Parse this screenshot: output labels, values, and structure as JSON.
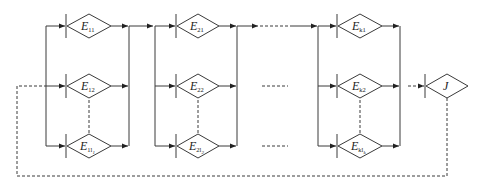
{
  "diagram": {
    "type": "series-parallel block diagram with feedback",
    "stroke_color": "#3a3a3a",
    "background": "#ffffff",
    "stages": [
      {
        "id": "stage-1",
        "nodes": [
          {
            "symbol": "E",
            "sub": "11",
            "subsub": ""
          },
          {
            "symbol": "E",
            "sub": "12",
            "subsub": ""
          },
          {
            "symbol": "E",
            "sub": "1l",
            "subsub": "1"
          }
        ]
      },
      {
        "id": "stage-2",
        "nodes": [
          {
            "symbol": "E",
            "sub": "21",
            "subsub": ""
          },
          {
            "symbol": "E",
            "sub": "22",
            "subsub": ""
          },
          {
            "symbol": "E",
            "sub": "2l",
            "subsub": "2"
          }
        ]
      },
      {
        "id": "stage-k",
        "nodes": [
          {
            "symbol": "E",
            "sub": "k1",
            "subsub": ""
          },
          {
            "symbol": "E",
            "sub": "k2",
            "subsub": ""
          },
          {
            "symbol": "E",
            "sub": "kl",
            "subsub": "k"
          }
        ]
      }
    ],
    "output": {
      "symbol": "J"
    },
    "feedback": "dashed loop from J back to stage-1 input"
  }
}
